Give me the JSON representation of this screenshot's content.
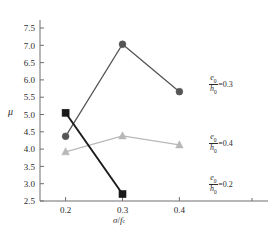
{
  "chart_data": {
    "type": "line",
    "title": "",
    "xlabel": "σ/f_c",
    "ylabel": "μ",
    "x": [
      0.2,
      0.3,
      0.4
    ],
    "xticklabels": [
      "0.2",
      "0.3",
      "0.4"
    ],
    "yticklabels": [
      "2.5",
      "3.0",
      "3.5",
      "4.0",
      "4.5",
      "5.0",
      "5.5",
      "6.0",
      "6.5",
      "7.0",
      "7.5"
    ],
    "xlim": [
      0.155,
      0.445
    ],
    "ylim": [
      2.5,
      7.5
    ],
    "ytick_step": 0.5,
    "grid": false,
    "legend_position": "inline-right-annotations",
    "series": [
      {
        "name": "e0/h0=0.2",
        "marker": "square",
        "color": "#1a1a1a",
        "line_color": "#1a1a1a",
        "x": [
          0.2,
          0.3
        ],
        "values": [
          5.05,
          2.7
        ]
      },
      {
        "name": "e0/h0=0.3",
        "marker": "circle",
        "color": "#555555",
        "line_color": "#555555",
        "x": [
          0.2,
          0.3,
          0.4
        ],
        "values": [
          4.37,
          7.03,
          5.66
        ]
      },
      {
        "name": "e0/h0=0.4",
        "marker": "triangle",
        "color": "#b8b8b8",
        "line_color": "#b8b8b8",
        "x": [
          0.2,
          0.3,
          0.4
        ],
        "values": [
          3.92,
          4.38,
          4.12
        ]
      }
    ],
    "annotations": [
      {
        "numerator": "e",
        "numerator_sub": "0",
        "denominator": "h",
        "denominator_sub": "0",
        "equals_value": "=0.3",
        "series": "e0/h0=0.3"
      },
      {
        "numerator": "e",
        "numerator_sub": "0",
        "denominator": "h",
        "denominator_sub": "0",
        "equals_value": "=0.4",
        "series": "e0/h0=0.4"
      },
      {
        "numerator": "e",
        "numerator_sub": "0",
        "denominator": "h",
        "denominator_sub": "0",
        "equals_value": "=0.2",
        "series": "e0/h0=0.2"
      }
    ]
  },
  "axes": {
    "y_title": "μ",
    "x_title_numerator": "σ",
    "x_title_denominator": "f",
    "x_title_denominator_sub": "c"
  }
}
